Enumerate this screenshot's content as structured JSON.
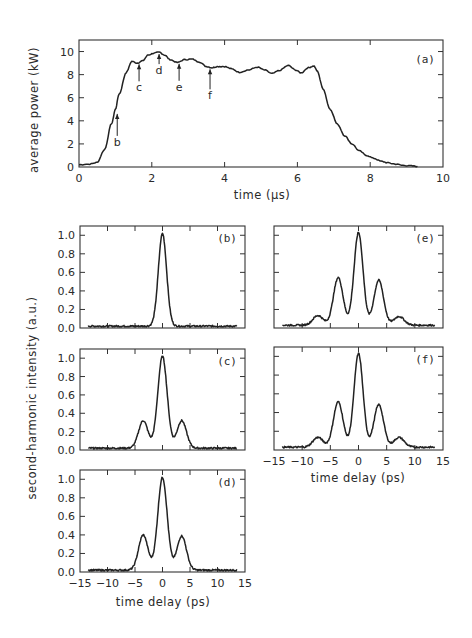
{
  "chart_data": [
    {
      "id": "a",
      "type": "line",
      "panel_label": "(a)",
      "title": "",
      "xlabel": "time  (µs)",
      "ylabel": "average power    (kW)",
      "xlim": [
        0,
        10
      ],
      "ylim": [
        0,
        11
      ],
      "xticks": [
        0,
        2,
        4,
        6,
        8,
        10
      ],
      "yticks": [
        0,
        2,
        4,
        6,
        8,
        10
      ],
      "grid": false,
      "series": [
        {
          "name": "average power",
          "x": [
            0,
            0.3,
            0.5,
            0.7,
            0.9,
            1.0,
            1.1,
            1.3,
            1.45,
            1.6,
            1.75,
            1.9,
            2.05,
            2.2,
            2.35,
            2.5,
            2.7,
            2.9,
            3.1,
            3.3,
            3.5,
            3.65,
            3.8,
            4.0,
            4.2,
            4.4,
            4.65,
            4.9,
            5.1,
            5.3,
            5.5,
            5.75,
            5.95,
            6.1,
            6.3,
            6.45,
            6.55,
            6.7,
            6.9,
            7.1,
            7.3,
            7.5,
            7.7,
            7.9,
            8.1,
            8.3,
            8.5,
            8.7,
            8.9,
            9.1,
            9.3
          ],
          "y": [
            0.2,
            0.25,
            0.4,
            1.5,
            3.8,
            5.0,
            6.3,
            8.2,
            9.15,
            9.0,
            9.2,
            9.7,
            9.85,
            9.95,
            9.7,
            9.3,
            9.05,
            9.3,
            9.35,
            9.1,
            8.7,
            8.6,
            8.7,
            8.7,
            8.5,
            8.2,
            8.4,
            8.65,
            8.4,
            8.1,
            8.35,
            8.8,
            8.4,
            8.15,
            8.6,
            8.75,
            8.3,
            6.8,
            5.0,
            3.7,
            2.7,
            2.0,
            1.4,
            1.0,
            0.75,
            0.5,
            0.35,
            0.25,
            0.15,
            0.1,
            0.05
          ]
        }
      ],
      "annotations": [
        {
          "label": "b",
          "x": 1.05
        },
        {
          "label": "c",
          "x": 1.65
        },
        {
          "label": "d",
          "x": 2.2
        },
        {
          "label": "e",
          "x": 2.75
        },
        {
          "label": "f",
          "x": 3.6
        }
      ]
    },
    {
      "id": "b",
      "type": "line",
      "panel_label": "(b)",
      "xlabel": "",
      "ylabel": "second-harmonic intensity    (a.u.)",
      "xlim": [
        -15,
        15
      ],
      "ylim": [
        0,
        1.1
      ],
      "xticks": [
        -15,
        -10,
        -5,
        0,
        5,
        10,
        15
      ],
      "yticks": [
        0.0,
        0.2,
        0.4,
        0.6,
        0.8,
        1.0
      ],
      "peaks": [
        {
          "x": 0,
          "y": 1.0,
          "width": 0.75
        }
      ],
      "baseline": 0.02,
      "trace_range": [
        -13.5,
        13.5
      ]
    },
    {
      "id": "c",
      "type": "line",
      "panel_label": "(c)",
      "xlabel": "",
      "ylabel": "",
      "xlim": [
        -15,
        15
      ],
      "ylim": [
        0,
        1.1
      ],
      "xticks": [
        -15,
        -10,
        -5,
        0,
        5,
        10,
        15
      ],
      "yticks": [
        0.0,
        0.2,
        0.4,
        0.6,
        0.8,
        1.0
      ],
      "peaks": [
        {
          "x": -3.5,
          "y": 0.31,
          "width": 0.85
        },
        {
          "x": 0,
          "y": 1.0,
          "width": 0.85
        },
        {
          "x": 3.5,
          "y": 0.31,
          "width": 0.85
        }
      ],
      "baseline": 0.02,
      "trace_range": [
        -13.5,
        13.5
      ]
    },
    {
      "id": "d",
      "type": "line",
      "panel_label": "(d)",
      "xlabel": "time delay     (ps)",
      "ylabel": "",
      "xlim": [
        -15,
        15
      ],
      "ylim": [
        0,
        1.1
      ],
      "xticks": [
        -15,
        -10,
        -5,
        0,
        5,
        10,
        15
      ],
      "yticks": [
        0.0,
        0.2,
        0.4,
        0.6,
        0.8,
        1.0
      ],
      "peaks": [
        {
          "x": -3.5,
          "y": 0.39,
          "width": 0.85
        },
        {
          "x": 0,
          "y": 1.0,
          "width": 0.85
        },
        {
          "x": 3.5,
          "y": 0.38,
          "width": 0.85
        }
      ],
      "baseline": 0.02,
      "trace_range": [
        -13.5,
        13.5
      ]
    },
    {
      "id": "e",
      "type": "line",
      "panel_label": "(e)",
      "xlabel": "",
      "ylabel": "",
      "xlim": [
        -15,
        15
      ],
      "ylim": [
        0,
        1.1
      ],
      "xticks": [
        -15,
        -10,
        -5,
        0,
        5,
        10,
        15
      ],
      "yticks": [
        0.0,
        0.2,
        0.4,
        0.6,
        0.8,
        1.0
      ],
      "peaks": [
        {
          "x": -7.2,
          "y": 0.12,
          "width": 0.9
        },
        {
          "x": -3.6,
          "y": 0.53,
          "width": 0.85
        },
        {
          "x": 0,
          "y": 1.0,
          "width": 0.8
        },
        {
          "x": 3.6,
          "y": 0.5,
          "width": 0.85
        },
        {
          "x": 7.2,
          "y": 0.11,
          "width": 0.9
        }
      ],
      "baseline": 0.03,
      "trace_range": [
        -13.5,
        13.5
      ]
    },
    {
      "id": "f",
      "type": "line",
      "panel_label": "(f)",
      "xlabel": "time delay     (ps)",
      "ylabel": "",
      "xlim": [
        -15,
        15
      ],
      "ylim": [
        0,
        1.1
      ],
      "xticks": [
        -15,
        -10,
        -5,
        0,
        5,
        10,
        15
      ],
      "yticks": [
        0.0,
        0.2,
        0.4,
        0.6,
        0.8,
        1.0
      ],
      "peaks": [
        {
          "x": -7.2,
          "y": 0.12,
          "width": 0.9
        },
        {
          "x": -3.6,
          "y": 0.5,
          "width": 0.85
        },
        {
          "x": 0,
          "y": 1.0,
          "width": 0.8
        },
        {
          "x": 3.6,
          "y": 0.47,
          "width": 0.85
        },
        {
          "x": 7.2,
          "y": 0.12,
          "width": 0.9
        }
      ],
      "baseline": 0.03,
      "trace_range": [
        -13.5,
        13.5
      ]
    }
  ],
  "layout": {
    "a": {
      "x0": 79,
      "x1": 443,
      "y0": 40,
      "y1": 167
    },
    "b": {
      "x0": 80,
      "x1": 245,
      "y0": 226,
      "y1": 328,
      "show_xticklabels": false,
      "show_yticklabels": true
    },
    "c": {
      "x0": 80,
      "x1": 245,
      "y0": 349,
      "y1": 450,
      "show_xticklabels": false,
      "show_yticklabels": true
    },
    "d": {
      "x0": 80,
      "x1": 245,
      "y0": 470,
      "y1": 572,
      "show_xticklabels": true,
      "show_yticklabels": true
    },
    "e": {
      "x0": 274,
      "x1": 443,
      "y0": 226,
      "y1": 328,
      "show_xticklabels": false,
      "show_yticklabels": false
    },
    "f": {
      "x0": 274,
      "x1": 443,
      "y0": 347,
      "y1": 450,
      "show_xticklabels": true,
      "show_yticklabels": false
    }
  },
  "labels": {
    "top_ylabel": "average power    (kW)",
    "top_xlabel": "time  (µs)",
    "bottom_ylabel": "second-harmonic intensity    (a.u.)",
    "bottom_xlabel_left": "time delay     (ps)",
    "bottom_xlabel_right": "time delay     (ps)"
  }
}
